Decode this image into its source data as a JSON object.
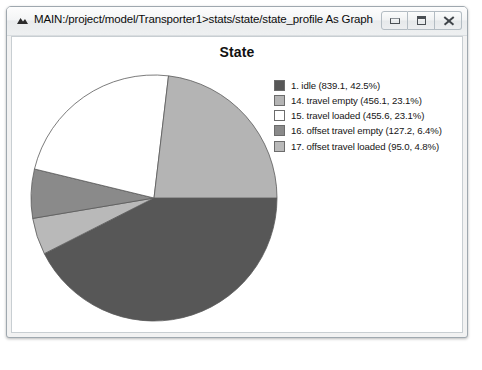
{
  "window": {
    "title": "MAIN:/project/model/Transporter1>stats/state/state_profile As Graph",
    "icon": "app-logo-icon",
    "buttons": {
      "minimize": "Minimize",
      "restore": "Restore",
      "close": "Close"
    }
  },
  "chart_data": {
    "type": "pie",
    "title": "State",
    "xlabel": "",
    "ylabel": "",
    "legend_position": "top-right",
    "start_angle_deg": 0,
    "direction": "clockwise",
    "categories": [
      "1. idle",
      "17. offset travel loaded",
      "16. offset travel empty",
      "15. travel loaded",
      "14. travel empty"
    ],
    "values": [
      839.1,
      95.0,
      127.2,
      455.6,
      456.1
    ],
    "percents": [
      42.5,
      4.8,
      6.4,
      23.1,
      23.1
    ],
    "colors": [
      "#575757",
      "#b9b9b9",
      "#8a8a8a",
      "#ffffff",
      "#b4b4b4"
    ],
    "slices": [
      {
        "index": "1",
        "name": "idle",
        "value": 839.1,
        "percent": 42.5,
        "color": "#575757"
      },
      {
        "index": "17",
        "name": "offset travel loaded",
        "value": 95.0,
        "percent": 4.8,
        "color": "#b9b9b9"
      },
      {
        "index": "16",
        "name": "offset travel empty",
        "value": 127.2,
        "percent": 6.4,
        "color": "#8a8a8a"
      },
      {
        "index": "15",
        "name": "travel loaded",
        "value": 455.6,
        "percent": 23.1,
        "color": "#ffffff"
      },
      {
        "index": "14",
        "name": "travel empty",
        "value": 456.1,
        "percent": 23.1,
        "color": "#b4b4b4"
      }
    ]
  },
  "legend": {
    "items": [
      {
        "label": "1. idle (839.1, 42.5%)",
        "color": "#575757"
      },
      {
        "label": "14. travel empty (456.1, 23.1%)",
        "color": "#b4b4b4"
      },
      {
        "label": "15. travel loaded (455.6, 23.1%)",
        "color": "#ffffff"
      },
      {
        "label": "16. offset travel empty (127.2, 6.4%)",
        "color": "#8a8a8a"
      },
      {
        "label": "17. offset travel loaded (95.0, 4.8%)",
        "color": "#b9b9b9"
      }
    ]
  }
}
